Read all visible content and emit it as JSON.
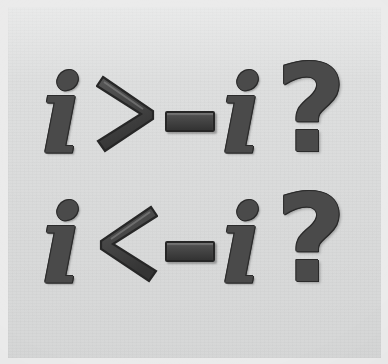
{
  "image": {
    "kind": "scanned-math-expression",
    "background_color": "#dddede",
    "border_color": "#ebebeb",
    "ink_color": "#4a4a4a",
    "ink_outline_color": "#2b2b2b",
    "ink_highlight_color": "#8a8a8a"
  },
  "expressions": [
    {
      "id": "row-1",
      "text": "i > -i ?",
      "tokens": [
        {
          "name": "variable-i",
          "glyph": "i"
        },
        {
          "name": "greater-than",
          "glyph": ">"
        },
        {
          "name": "minus-sign",
          "glyph": "-"
        },
        {
          "name": "variable-i",
          "glyph": "i"
        },
        {
          "name": "question-mark",
          "glyph": "?"
        }
      ]
    },
    {
      "id": "row-2",
      "text": "i < -i ?",
      "tokens": [
        {
          "name": "variable-i",
          "glyph": "i"
        },
        {
          "name": "less-than",
          "glyph": "<"
        },
        {
          "name": "minus-sign",
          "glyph": "-"
        },
        {
          "name": "variable-i",
          "glyph": "i"
        },
        {
          "name": "question-mark",
          "glyph": "?"
        }
      ]
    }
  ]
}
